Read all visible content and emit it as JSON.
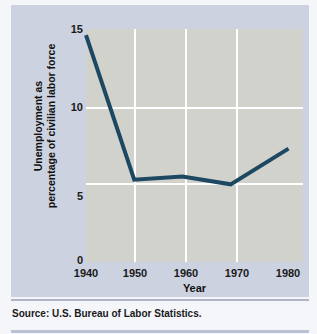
{
  "figure": {
    "source_note": "Source: U.S. Bureau of Labor Statistics.",
    "panel_color": "#ccd2e0",
    "plot_color": "#d2d2cd",
    "line_color": "#1d4862",
    "grid_color": "#ffffff"
  },
  "chart_data": {
    "type": "line",
    "title": "",
    "xlabel": "Year",
    "ylabel": "Unemployment as percentage of civilian labor force",
    "ylabel_lines": [
      "Unemployment as",
      "percentage of civilian labor force"
    ],
    "x": [
      1940,
      1950,
      1960,
      1970,
      1982
    ],
    "values": [
      14.6,
      5.3,
      5.5,
      5.0,
      7.3
    ],
    "series": [
      {
        "name": "Unemployment rate",
        "values": [
          14.6,
          5.3,
          5.5,
          5.0,
          7.3
        ]
      }
    ],
    "xtick_labels": [
      "1940",
      "1950",
      "1960",
      "1970",
      "1980"
    ],
    "xticks": [
      1940,
      1950,
      1960,
      1970,
      1980
    ],
    "ytick_labels": [
      "15",
      "10",
      "5",
      "0"
    ],
    "yticks": [
      15,
      10,
      5,
      0
    ],
    "xlim": [
      1940,
      1985
    ],
    "ylim": [
      0,
      15
    ],
    "grid": "horizontal-and-vertical",
    "legend": "none",
    "line_color": "#1d4862",
    "line_width": 4
  }
}
